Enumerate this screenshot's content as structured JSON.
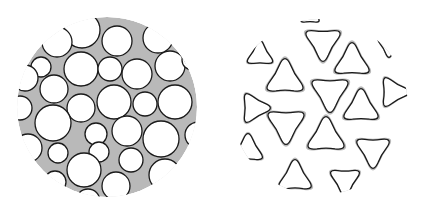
{
  "figure": {
    "width": 428,
    "height": 213,
    "background": "#ffffff",
    "matrix_color": "#b9b9b9",
    "outline_color": "#1a1a1a",
    "pore_color": "#ffffff"
  },
  "panels": [
    {
      "name": "spherical-pore-structure",
      "cx": 107,
      "cy": 107,
      "r": 90,
      "cells": [
        {
          "x": 82,
          "y": 30,
          "r": 18
        },
        {
          "x": 117,
          "y": 41,
          "r": 15
        },
        {
          "x": 41,
          "y": 67,
          "r": 10
        },
        {
          "x": 81,
          "y": 69,
          "r": 17
        },
        {
          "x": 110,
          "y": 69,
          "r": 12
        },
        {
          "x": 137,
          "y": 74,
          "r": 15
        },
        {
          "x": 170,
          "y": 66,
          "r": 15
        },
        {
          "x": 54,
          "y": 89,
          "r": 14
        },
        {
          "x": 81,
          "y": 108,
          "r": 14
        },
        {
          "x": 114,
          "y": 102,
          "r": 17
        },
        {
          "x": 145,
          "y": 104,
          "r": 12
        },
        {
          "x": 175,
          "y": 102,
          "r": 17
        },
        {
          "x": 20,
          "y": 108,
          "r": 12
        },
        {
          "x": 53,
          "y": 123,
          "r": 18
        },
        {
          "x": 96,
          "y": 134,
          "r": 11
        },
        {
          "x": 127,
          "y": 131,
          "r": 15
        },
        {
          "x": 161,
          "y": 139,
          "r": 18
        },
        {
          "x": 58,
          "y": 153,
          "r": 10
        },
        {
          "x": 99,
          "y": 152,
          "r": 10
        },
        {
          "x": 131,
          "y": 160,
          "r": 12
        },
        {
          "x": 84,
          "y": 170,
          "r": 17
        },
        {
          "x": 116,
          "y": 186,
          "r": 14
        },
        {
          "x": 165,
          "y": 175,
          "r": 16
        },
        {
          "x": 55,
          "y": 182,
          "r": 11
        },
        {
          "x": 28,
          "y": 148,
          "r": 14
        },
        {
          "x": 25,
          "y": 78,
          "r": 13
        },
        {
          "x": 57,
          "y": 42,
          "r": 15
        },
        {
          "x": 158,
          "y": 38,
          "r": 15
        },
        {
          "x": 198,
          "y": 135,
          "r": 13
        },
        {
          "x": 88,
          "y": 201,
          "r": 12
        },
        {
          "x": 192,
          "y": 60,
          "r": 10
        }
      ]
    },
    {
      "name": "trigonal-pore-structure",
      "cx": 320,
      "cy": 107,
      "r": 88,
      "cells": [
        {
          "x": 323,
          "y": 42,
          "s": 19,
          "rot": 180
        },
        {
          "x": 352,
          "y": 62,
          "s": 19,
          "rot": 0
        },
        {
          "x": 285,
          "y": 79,
          "s": 20,
          "rot": 0
        },
        {
          "x": 330,
          "y": 92,
          "s": 20,
          "rot": 180
        },
        {
          "x": 361,
          "y": 108,
          "s": 19,
          "rot": 0
        },
        {
          "x": 286,
          "y": 124,
          "s": 20,
          "rot": 180
        },
        {
          "x": 326,
          "y": 137,
          "s": 20,
          "rot": 0
        },
        {
          "x": 373,
          "y": 150,
          "s": 18,
          "rot": 180
        },
        {
          "x": 254,
          "y": 108,
          "s": 16,
          "rot": 90
        },
        {
          "x": 260,
          "y": 55,
          "s": 14,
          "rot": 0
        },
        {
          "x": 393,
          "y": 92,
          "s": 16,
          "rot": 90
        },
        {
          "x": 389,
          "y": 45,
          "s": 12,
          "rot": 180
        },
        {
          "x": 248,
          "y": 150,
          "s": 16,
          "rot": 0
        },
        {
          "x": 295,
          "y": 178,
          "s": 18,
          "rot": 0
        },
        {
          "x": 345,
          "y": 180,
          "s": 16,
          "rot": 180
        },
        {
          "x": 310,
          "y": 16,
          "s": 10,
          "rot": 0
        },
        {
          "x": 270,
          "y": 200,
          "s": 12,
          "rot": 180
        }
      ]
    }
  ]
}
